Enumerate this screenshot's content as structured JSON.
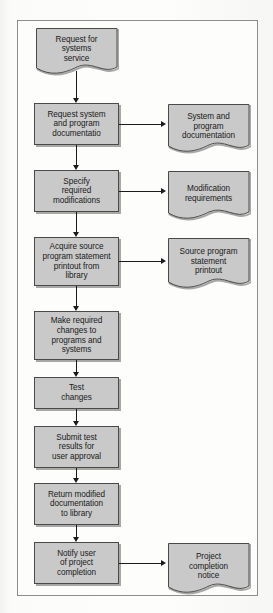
{
  "diagram": {
    "colors": {
      "node_fill": "#c9c9c9",
      "node_stroke": "#4a4a4a",
      "connector": "#1b1b1b",
      "frame_stroke": "#8d8d8d",
      "page_background": "#fbfbfa",
      "frame_background": "#fdfdfc"
    },
    "process_nodes": [
      {
        "id": "request-system-documentation",
        "label": "Request system\nand program\ndocumentatio"
      },
      {
        "id": "specify-modifications",
        "label": "Specify\nrequired\nmodifications"
      },
      {
        "id": "acquire-source-printout",
        "label": "Acquire source\nprogram statement\nprintout from\nlibrary"
      },
      {
        "id": "make-changes",
        "label": "Make required\nchanges to\nprograms and\nsystems"
      },
      {
        "id": "test-changes",
        "label": "Test\nchanges"
      },
      {
        "id": "submit-test-results",
        "label": "Submit test\nresults for\nuser approval"
      },
      {
        "id": "return-documentation",
        "label": "Return modified\ndocumentation\nto library"
      },
      {
        "id": "notify-user",
        "label": "Notify user\nof project\ncompletion"
      }
    ],
    "document_nodes": [
      {
        "id": "request-for-service",
        "label": "Request for\nsystems\nservice"
      },
      {
        "id": "system-program-documentation",
        "label": "System and\nprogram\ndocumentation"
      },
      {
        "id": "modification-requirements",
        "label": "Modification\nrequirements"
      },
      {
        "id": "source-program-printout",
        "label": "Source program\nstatement\nprintout"
      },
      {
        "id": "project-completion-notice",
        "label": "Project\ncompletion\nnotice"
      }
    ],
    "connectors": [
      {
        "id": "flow-request-to-request-system",
        "type": "vertical-arrow"
      },
      {
        "id": "flow-request-system-to-specify",
        "type": "vertical-arrow"
      },
      {
        "id": "flow-specify-to-acquire",
        "type": "vertical-arrow"
      },
      {
        "id": "flow-acquire-to-make-changes",
        "type": "vertical-arrow"
      },
      {
        "id": "flow-make-changes-to-test",
        "type": "vertical-arrow"
      },
      {
        "id": "flow-test-to-submit",
        "type": "vertical-arrow"
      },
      {
        "id": "flow-submit-to-return",
        "type": "vertical-arrow"
      },
      {
        "id": "flow-return-to-notify",
        "type": "vertical-arrow"
      },
      {
        "id": "flow-request-system-to-doc",
        "type": "horizontal-arrow"
      },
      {
        "id": "flow-specify-to-requirements",
        "type": "horizontal-arrow"
      },
      {
        "id": "flow-acquire-to-printout",
        "type": "horizontal-arrow"
      },
      {
        "id": "flow-notify-to-notice",
        "type": "horizontal-arrow"
      }
    ]
  }
}
